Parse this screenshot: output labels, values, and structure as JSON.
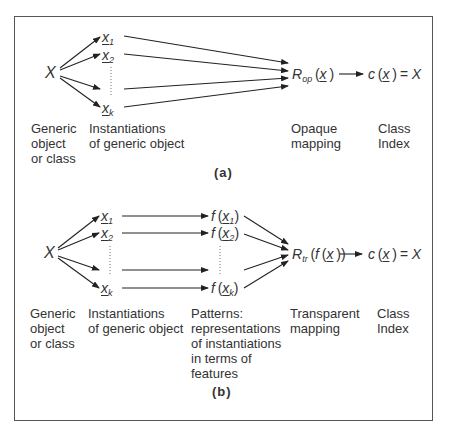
{
  "diagram_a": {
    "source": "X",
    "instances": [
      {
        "var": "x",
        "sub": "1"
      },
      {
        "var": "x",
        "sub": "2"
      },
      {
        "var": "x",
        "sub": "k"
      }
    ],
    "mapping": {
      "name": "R",
      "sub": "op",
      "arg": "x"
    },
    "result": {
      "fn": "c",
      "arg": "x",
      "eq": "= X"
    },
    "labels": {
      "generic": [
        "Generic",
        "object",
        "or class"
      ],
      "instantiations": [
        "Instantiations",
        "of generic object"
      ],
      "mapping": [
        "Opaque",
        "mapping"
      ],
      "class_index": [
        "Class",
        "Index"
      ]
    },
    "caption": "(a)"
  },
  "diagram_b": {
    "source": "X",
    "instances": [
      {
        "var": "x",
        "sub": "1"
      },
      {
        "var": "x",
        "sub": "2"
      },
      {
        "var": "x",
        "sub": "k"
      }
    ],
    "patterns": [
      {
        "fn": "f",
        "var": "x",
        "sub": "1"
      },
      {
        "fn": "f",
        "var": "x",
        "sub": "2"
      },
      {
        "fn": "f",
        "var": "x",
        "sub": "k"
      }
    ],
    "mapping": {
      "name": "R",
      "sub": "tr",
      "arg": "f(x)"
    },
    "result": {
      "fn": "c",
      "arg": "x",
      "eq": "= X"
    },
    "labels": {
      "generic": [
        "Generic",
        "object",
        "or class"
      ],
      "instantiations": [
        "Instantiations",
        "of generic object"
      ],
      "patterns": [
        "Patterns:",
        "representations",
        "of instantiations",
        "in terms of",
        "features"
      ],
      "mapping": [
        "Transparent",
        "mapping"
      ],
      "class_index": [
        "Class",
        "Index"
      ]
    },
    "caption": "(b)"
  }
}
